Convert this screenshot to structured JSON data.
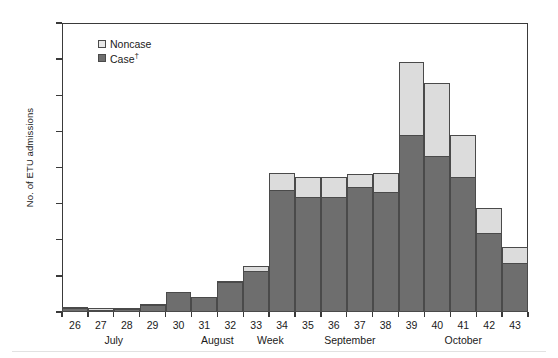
{
  "chart_data": {
    "type": "bar",
    "subtype": "stacked-column-epidemic-curve",
    "title": "",
    "xlabel": "Week",
    "ylabel": "No. of ETU admissions",
    "ylim": [
      0,
      400
    ],
    "ytick_step": 50,
    "yticks": [
      0,
      50,
      100,
      150,
      200,
      250,
      300,
      350,
      400
    ],
    "grid": false,
    "legend_position": "top-left",
    "categories": [
      "26",
      "27",
      "28",
      "29",
      "30",
      "31",
      "32",
      "33",
      "34",
      "35",
      "36",
      "37",
      "38",
      "39",
      "40",
      "41",
      "42",
      "43"
    ],
    "series": [
      {
        "name": "Case",
        "color": "#6e6e6e",
        "values": [
          4,
          2,
          3,
          8,
          26,
          20,
          40,
          55,
          168,
          158,
          158,
          172,
          165,
          243,
          215,
          185,
          108,
          67
        ]
      },
      {
        "name": "Noncase",
        "color": "#dcdcdc",
        "values": [
          1,
          2,
          1,
          1,
          0,
          0,
          1,
          7,
          23,
          28,
          27,
          18,
          26,
          102,
          100,
          58,
          35,
          21
        ]
      }
    ],
    "totals": [
      5,
      4,
      4,
      9,
      26,
      20,
      41,
      62,
      191,
      186,
      185,
      190,
      191,
      345,
      315,
      243,
      143,
      88
    ],
    "month_groups": [
      {
        "label": "July",
        "weeks": [
          "26",
          "27",
          "28",
          "29"
        ]
      },
      {
        "label": "August",
        "weeks": [
          "30",
          "31",
          "32",
          "33"
        ]
      },
      {
        "label": "September",
        "weeks": [
          "34",
          "35",
          "36",
          "37",
          "38"
        ]
      },
      {
        "label": "October",
        "weeks": [
          "39",
          "40",
          "41",
          "42",
          "43"
        ]
      }
    ]
  },
  "axes": {
    "y_title": "No. of ETU admissions",
    "y_tick_labels": [
      "400",
      "350",
      "300",
      "250",
      "200",
      "150",
      "100",
      "50",
      "0"
    ],
    "x_tick_labels": [
      "26",
      "27",
      "28",
      "29",
      "30",
      "31",
      "32",
      "33",
      "34",
      "35",
      "36",
      "37",
      "38",
      "39",
      "40",
      "41",
      "42",
      "43"
    ],
    "x_axis_word": "Week"
  },
  "month_labels": {
    "july": "July",
    "august": "August",
    "september": "September",
    "october": "October"
  },
  "legend": {
    "items": [
      {
        "label": "Noncase",
        "dagger": "",
        "swatch": "noncase"
      },
      {
        "label": "Case",
        "dagger": "†",
        "swatch": "case"
      }
    ]
  },
  "colors": {
    "case_fill": "#6e6e6e",
    "noncase_fill": "#dcdcdc",
    "outline": "#4a4a4a",
    "axis": "#3a3a3a",
    "text": "#1a1a1a",
    "background": "#ffffff"
  }
}
